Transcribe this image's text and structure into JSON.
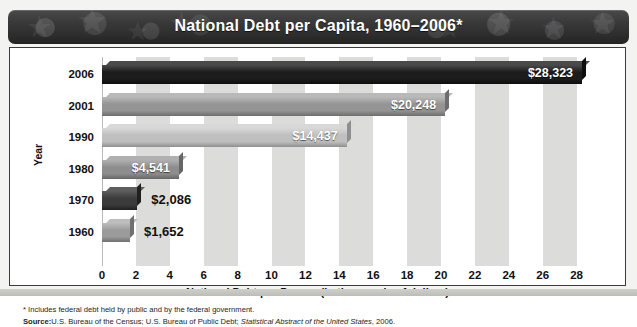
{
  "title": "National Debt per Capita, 1960–2006*",
  "panel": {
    "y_axis_title": "Year",
    "x_axis_title": "National Debt per Person (in thousands of dollars)"
  },
  "footnotes": {
    "asterisk": "* Includes federal debt held by public and by the federal government.",
    "source_label": "Source:",
    "source_text_1": "U.S. Bureau of the Census; U.S. Bureau of Public Debt; ",
    "source_italic": "Statistical Abstract of the United States",
    "source_text_2": ", 2006."
  },
  "chart_data": {
    "type": "bar",
    "orientation": "horizontal",
    "title": "National Debt per Capita, 1960–2006*",
    "xlabel": "National Debt per Person (in thousands of dollars)",
    "ylabel": "Year",
    "xlim": [
      0,
      29.5
    ],
    "xticks": [
      0,
      2,
      4,
      6,
      8,
      10,
      12,
      14,
      16,
      18,
      20,
      22,
      24,
      26,
      28
    ],
    "grid": "alternating vertical bands every 2 units",
    "legend": "none",
    "categories": [
      "2006",
      "2001",
      "1990",
      "1980",
      "1970",
      "1960"
    ],
    "values": [
      28.323,
      20.248,
      14.437,
      4.541,
      2.086,
      1.652
    ],
    "value_labels": [
      "$28,323",
      "$20,248",
      "$14,437",
      "$4,541",
      "$2,086",
      "$1,652"
    ],
    "bars": [
      {
        "year": "2006",
        "value": 28.323,
        "label": "$28,323",
        "label_inside": true,
        "color": "#1c1c1c",
        "top_color": "#4a4a4a",
        "side_color": "#0e0e0e"
      },
      {
        "year": "2001",
        "value": 20.248,
        "label": "$20,248",
        "label_inside": true,
        "color": "#949494",
        "top_color": "#b9b9b9",
        "side_color": "#6d6d6d"
      },
      {
        "year": "1990",
        "value": 14.437,
        "label": "$14,437",
        "label_inside": true,
        "color": "#bfbfbf",
        "top_color": "#d8d8d8",
        "side_color": "#8f8f8f"
      },
      {
        "year": "1980",
        "value": 4.541,
        "label": "$4,541",
        "label_inside": true,
        "color": "#8d8d8d",
        "top_color": "#b0b0b0",
        "side_color": "#666666"
      },
      {
        "year": "1970",
        "value": 2.086,
        "label": "$2,086",
        "label_inside": false,
        "color": "#3b3b3b",
        "top_color": "#5e5e5e",
        "side_color": "#202020"
      },
      {
        "year": "1960",
        "value": 1.652,
        "label": "$1,652",
        "label_inside": false,
        "color": "#9b9b9b",
        "top_color": "#bdbdbd",
        "side_color": "#707070"
      }
    ]
  },
  "colors": {
    "header_dark": "#2d2d2d",
    "panel_bg": "#ffffff",
    "band": "#dcdcda",
    "page_bg": "#f3f3f1"
  }
}
